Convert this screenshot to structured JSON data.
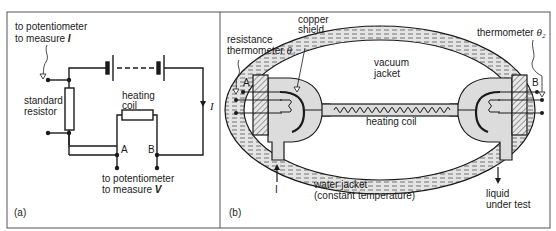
{
  "figure": {
    "panel_a": {
      "tag": "(a)",
      "labels": {
        "pot_I_line1": "to potentiometer",
        "pot_I_line2": "to measure ",
        "pot_I_symbol": "I",
        "standard_resistor_line1": "standard",
        "standard_resistor_line2": "resistor",
        "heating_coil_line1": "heating",
        "heating_coil_line2": "coil",
        "current_symbol": "I",
        "terminal_a": "A",
        "terminal_b": "B",
        "pot_V_line1": "to potentiometer",
        "pot_V_line2": "to measure ",
        "pot_V_symbol": "V"
      }
    },
    "panel_b": {
      "tag": "(b)",
      "labels": {
        "copper_shield_line1": "copper",
        "copper_shield_line2": "shield",
        "res_thermo_line1": "resistance",
        "res_thermo_line2": "thermometer ",
        "theta1": "θ₁",
        "thermo2": "thermometer ",
        "theta2": "θ₂",
        "vacuum_line1": "vacuum",
        "vacuum_line2": "jacket",
        "heating_coil": "heating coil",
        "terminal_a": "A",
        "terminal_b": "B",
        "inflow_symbol": "I",
        "water_jacket_line1": "water jacket",
        "water_jacket_line2": "(constant temperature)",
        "liquid_line1": "liquid",
        "liquid_line2": "under test"
      }
    },
    "colors": {
      "line": "#1a1a1a",
      "hatch_fill": "#d9d9d9",
      "body_fill": "#dcdcdc",
      "frame": "#555555"
    }
  }
}
